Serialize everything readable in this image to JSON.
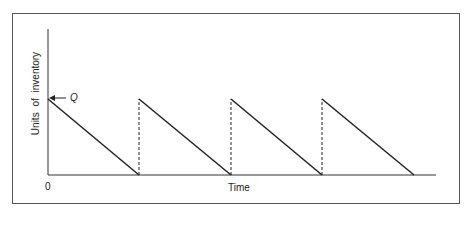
{
  "diagram": {
    "type": "sawtooth inventory diagram",
    "y_axis_label": "Units of  inventory",
    "x_axis_label": "Time",
    "origin_label": "0",
    "peak_label": "Q",
    "cycles": 4,
    "colors": {
      "line": "#222222",
      "frame": "#555555"
    }
  }
}
